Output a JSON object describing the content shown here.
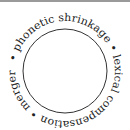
{
  "diagram": {
    "type": "cycle",
    "segments": [
      "phonetic shrinkage",
      "lexical compensation",
      "merger"
    ],
    "separator": "•",
    "ring_text": "• phonetic shrinkage • lexical compensation • merger ",
    "colors": {
      "text": "#222222",
      "circle": "#333333",
      "top_rule": "#9a9a9a"
    }
  }
}
